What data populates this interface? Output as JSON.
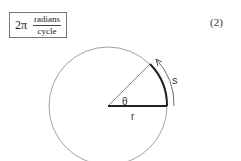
{
  "formula": {
    "coefficient": "2π",
    "numerator": "radians",
    "denominator": "cycle"
  },
  "equation_number": "(2)",
  "diagram": {
    "labels": {
      "angle": "θ",
      "radius": "r",
      "arc_length": "s"
    },
    "colors": {
      "circle": "#777777",
      "thick_lines": "#222222"
    }
  }
}
